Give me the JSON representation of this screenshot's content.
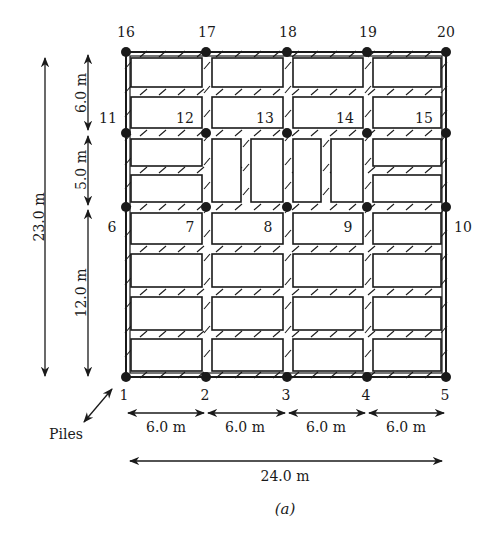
{
  "figure": {
    "caption": "(a)",
    "colors": {
      "line": "#1a1a1a",
      "background": "#ffffff"
    },
    "columns_x": [
      126,
      206,
      287,
      367,
      446
    ],
    "rows_y": [
      377,
      207,
      133,
      52
    ],
    "piles": [
      {
        "id": "1",
        "col": 0,
        "row": 0
      },
      {
        "id": "2",
        "col": 1,
        "row": 0
      },
      {
        "id": "3",
        "col": 2,
        "row": 0
      },
      {
        "id": "4",
        "col": 3,
        "row": 0
      },
      {
        "id": "5",
        "col": 4,
        "row": 0
      },
      {
        "id": "6",
        "col": 0,
        "row": 1
      },
      {
        "id": "7",
        "col": 1,
        "row": 1
      },
      {
        "id": "8",
        "col": 2,
        "row": 1
      },
      {
        "id": "9",
        "col": 3,
        "row": 1
      },
      {
        "id": "10",
        "col": 4,
        "row": 1
      },
      {
        "id": "11",
        "col": 0,
        "row": 2
      },
      {
        "id": "12",
        "col": 1,
        "row": 2
      },
      {
        "id": "13",
        "col": 2,
        "row": 2
      },
      {
        "id": "14",
        "col": 3,
        "row": 2
      },
      {
        "id": "15",
        "col": 4,
        "row": 2
      },
      {
        "id": "16",
        "col": 0,
        "row": 3
      },
      {
        "id": "17",
        "col": 1,
        "row": 3
      },
      {
        "id": "18",
        "col": 2,
        "row": 3
      },
      {
        "id": "19",
        "col": 3,
        "row": 3
      },
      {
        "id": "20",
        "col": 4,
        "row": 3
      }
    ],
    "pile_labels": [
      {
        "text": "1",
        "x": 124,
        "y": 400
      },
      {
        "text": "2",
        "x": 205,
        "y": 400
      },
      {
        "text": "3",
        "x": 286,
        "y": 400
      },
      {
        "text": "4",
        "x": 366,
        "y": 400
      },
      {
        "text": "5",
        "x": 445,
        "y": 400
      },
      {
        "text": "6",
        "x": 112,
        "y": 232
      },
      {
        "text": "7",
        "x": 190,
        "y": 232
      },
      {
        "text": "8",
        "x": 268,
        "y": 232
      },
      {
        "text": "9",
        "x": 348,
        "y": 232
      },
      {
        "text": "10",
        "x": 463,
        "y": 232
      },
      {
        "text": "11",
        "x": 108,
        "y": 123
      },
      {
        "text": "12",
        "x": 185,
        "y": 123
      },
      {
        "text": "13",
        "x": 265,
        "y": 123
      },
      {
        "text": "14",
        "x": 345,
        "y": 123
      },
      {
        "text": "15",
        "x": 424,
        "y": 123
      },
      {
        "text": "16",
        "x": 126,
        "y": 37
      },
      {
        "text": "17",
        "x": 207,
        "y": 37
      },
      {
        "text": "18",
        "x": 288,
        "y": 37
      },
      {
        "text": "19",
        "x": 368,
        "y": 37
      },
      {
        "text": "20",
        "x": 446,
        "y": 37
      }
    ],
    "panels": [
      {
        "x": 131,
        "y": 58,
        "w": 71,
        "h": 29
      },
      {
        "x": 212,
        "y": 58,
        "w": 71,
        "h": 29
      },
      {
        "x": 293,
        "y": 58,
        "w": 70,
        "h": 29
      },
      {
        "x": 373,
        "y": 58,
        "w": 68,
        "h": 29
      },
      {
        "x": 131,
        "y": 97,
        "w": 71,
        "h": 31
      },
      {
        "x": 212,
        "y": 97,
        "w": 71,
        "h": 31
      },
      {
        "x": 293,
        "y": 97,
        "w": 70,
        "h": 31
      },
      {
        "x": 373,
        "y": 97,
        "w": 68,
        "h": 31
      },
      {
        "x": 131,
        "y": 139,
        "w": 71,
        "h": 27
      },
      {
        "x": 131,
        "y": 175,
        "w": 71,
        "h": 27
      },
      {
        "x": 212,
        "y": 139,
        "w": 29,
        "h": 63
      },
      {
        "x": 251,
        "y": 139,
        "w": 32,
        "h": 63
      },
      {
        "x": 293,
        "y": 139,
        "w": 28,
        "h": 63
      },
      {
        "x": 331,
        "y": 139,
        "w": 32,
        "h": 63
      },
      {
        "x": 373,
        "y": 139,
        "w": 68,
        "h": 27
      },
      {
        "x": 373,
        "y": 175,
        "w": 68,
        "h": 27
      },
      {
        "x": 131,
        "y": 213,
        "w": 71,
        "h": 31
      },
      {
        "x": 212,
        "y": 213,
        "w": 71,
        "h": 31
      },
      {
        "x": 293,
        "y": 213,
        "w": 70,
        "h": 31
      },
      {
        "x": 373,
        "y": 213,
        "w": 68,
        "h": 31
      },
      {
        "x": 131,
        "y": 254,
        "w": 71,
        "h": 33
      },
      {
        "x": 212,
        "y": 254,
        "w": 71,
        "h": 33
      },
      {
        "x": 293,
        "y": 254,
        "w": 70,
        "h": 33
      },
      {
        "x": 373,
        "y": 254,
        "w": 68,
        "h": 33
      },
      {
        "x": 131,
        "y": 297,
        "w": 71,
        "h": 33
      },
      {
        "x": 212,
        "y": 297,
        "w": 71,
        "h": 33
      },
      {
        "x": 293,
        "y": 297,
        "w": 70,
        "h": 33
      },
      {
        "x": 373,
        "y": 297,
        "w": 68,
        "h": 33
      },
      {
        "x": 131,
        "y": 339,
        "w": 71,
        "h": 32
      },
      {
        "x": 212,
        "y": 339,
        "w": 71,
        "h": 32
      },
      {
        "x": 293,
        "y": 339,
        "w": 70,
        "h": 32
      },
      {
        "x": 373,
        "y": 339,
        "w": 68,
        "h": 32
      }
    ],
    "dimensions": {
      "vertical": [
        {
          "label": "23.0 m",
          "x": 45,
          "y1": 58,
          "y2": 376,
          "tx": 40,
          "ty": 217
        },
        {
          "label": "6.0 m",
          "x": 88,
          "y1": 55,
          "y2": 130,
          "tx": 82,
          "ty": 93
        },
        {
          "label": "5.0 m",
          "x": 88,
          "y1": 136,
          "y2": 205,
          "tx": 82,
          "ty": 170
        },
        {
          "label": "12.0 m",
          "x": 88,
          "y1": 210,
          "y2": 376,
          "tx": 82,
          "ty": 293
        }
      ],
      "horizontal": [
        {
          "label": "6.0 m",
          "y": 413,
          "x1": 128,
          "x2": 204,
          "tx": 166,
          "ty": 432
        },
        {
          "label": "6.0 m",
          "y": 413,
          "x1": 208,
          "x2": 285,
          "tx": 245,
          "ty": 432
        },
        {
          "label": "6.0 m",
          "y": 413,
          "x1": 289,
          "x2": 365,
          "tx": 326,
          "ty": 432
        },
        {
          "label": "6.0 m",
          "y": 413,
          "x1": 369,
          "x2": 444,
          "tx": 406,
          "ty": 432
        },
        {
          "label": "24.0 m",
          "y": 461,
          "x1": 130,
          "x2": 442,
          "tx": 285,
          "ty": 481
        }
      ]
    },
    "piles_pointer": {
      "label": "Piles",
      "tx": 66,
      "ty": 439,
      "x1": 84,
      "y1": 422,
      "x2": 112,
      "y2": 389
    }
  }
}
